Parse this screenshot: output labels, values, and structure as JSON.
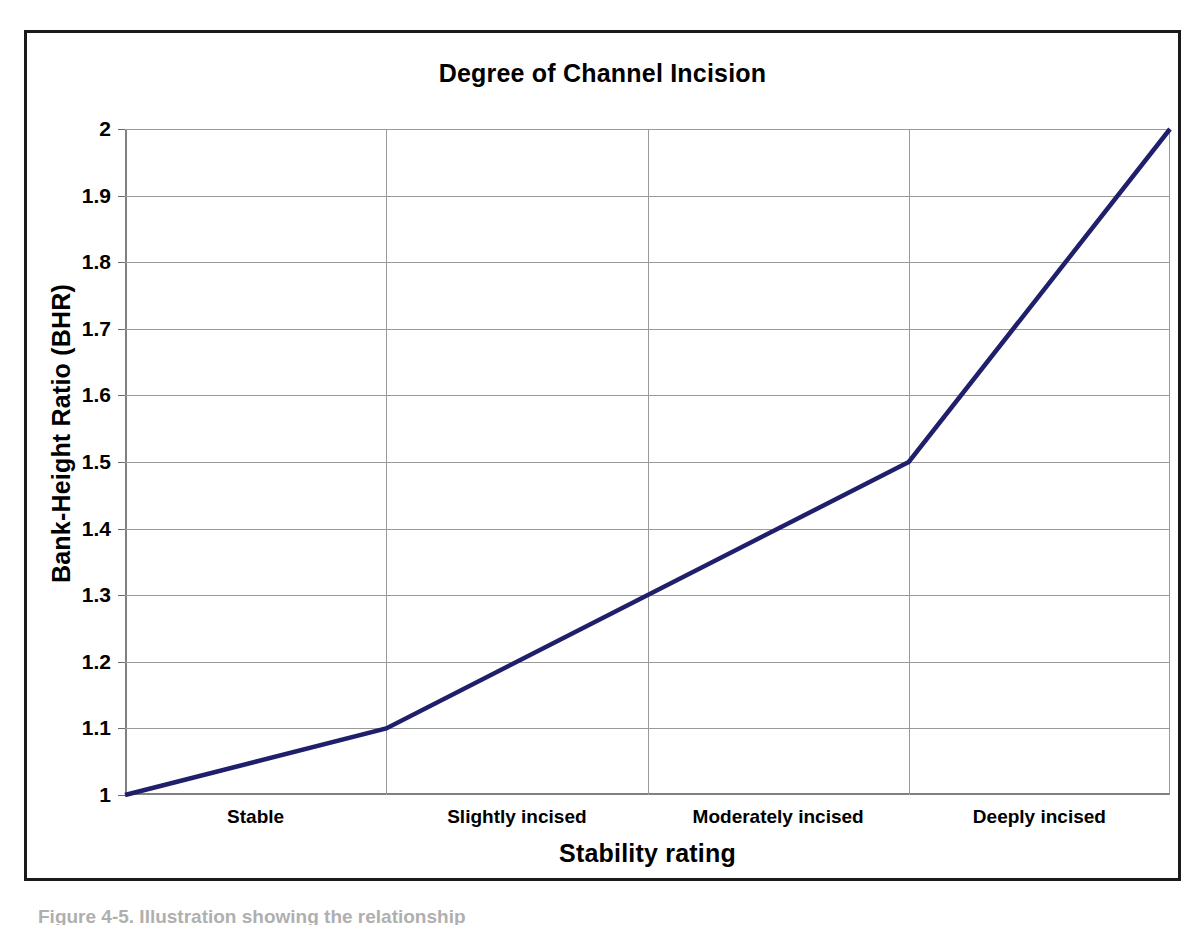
{
  "chart_data": {
    "type": "line",
    "title": "Degree of Channel Incision",
    "xlabel": "Stability rating",
    "ylabel": "Bank-Height Ratio (BHR)",
    "categories": [
      "Stable",
      "Slightly incised",
      "Moderately incised",
      "Deeply incised"
    ],
    "x_tick_labels": [
      "Stable",
      "Slightly incised",
      "Moderately incised",
      "Deeply incised"
    ],
    "y_tick_labels": [
      "2",
      "1.9",
      "1.8",
      "1.7",
      "1.6",
      "1.5",
      "1.4",
      "1.3",
      "1.2",
      "1.1",
      "1"
    ],
    "y_tick_values": [
      2,
      1.9,
      1.8,
      1.7,
      1.6,
      1.5,
      1.4,
      1.3,
      1.2,
      1.1,
      1
    ],
    "ylim": [
      1,
      2
    ],
    "xlim": [
      0,
      4
    ],
    "grid": true,
    "legend": "none",
    "series": [
      {
        "name": "Bank-Height Ratio",
        "color": "#1f1f6b",
        "points": [
          {
            "x": 0,
            "y": 1.0
          },
          {
            "x": 1,
            "y": 1.1
          },
          {
            "x": 3,
            "y": 1.5
          },
          {
            "x": 4,
            "y": 2.0
          }
        ],
        "x": [
          0,
          1,
          3,
          4
        ],
        "values": [
          1.0,
          1.1,
          1.5,
          2.0
        ]
      }
    ],
    "annotations": {
      "vertex_descriptions": [
        "Left axis start at BHR 1.0",
        "Boundary Stable / Slightly incised at BHR 1.1",
        "Boundary Moderately / Deeply incised at BHR 1.5",
        "Right axis end at BHR 2.0"
      ]
    }
  },
  "colors": {
    "line": "#1f1f6b",
    "gridline": "#9a9a9a",
    "axis": "#808080",
    "frame": "#1a1a1a",
    "text": "#000000",
    "background": "#ffffff"
  },
  "caption": {
    "text": "Figure 4-5. Illustration showing the relationship"
  }
}
